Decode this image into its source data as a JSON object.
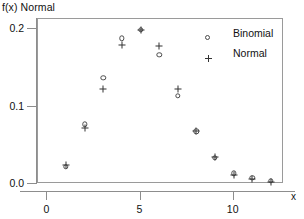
{
  "chart_data": {
    "type": "scatter",
    "title": "",
    "ylabel": "f(x) Normal",
    "xlabel": "x",
    "xlim": [
      -0.5,
      12.7
    ],
    "ylim": [
      0.0,
      0.213
    ],
    "grid": false,
    "x": [
      1,
      2,
      3,
      4,
      5,
      6,
      7,
      8,
      9,
      10,
      11,
      12
    ],
    "series": [
      {
        "name": "Binomial",
        "marker": "circle",
        "values": [
          0.022,
          0.077,
          0.137,
          0.188,
          0.199,
          0.167,
          0.114,
          0.068,
          0.034,
          0.014,
          0.008,
          0.004
        ]
      },
      {
        "name": "Normal",
        "marker": "plus",
        "values": [
          0.025,
          0.072,
          0.123,
          0.179,
          0.199,
          0.178,
          0.123,
          0.069,
          0.035,
          0.012,
          0.006,
          0.003
        ]
      }
    ],
    "yticks": [
      {
        "value": 0.0,
        "label": "0.0"
      },
      {
        "value": 0.1,
        "label": "0.1"
      },
      {
        "value": 0.2,
        "label": "0.2"
      }
    ],
    "xticks": [
      {
        "value": 0,
        "label": "0"
      },
      {
        "value": 5,
        "label": "5"
      },
      {
        "value": 10,
        "label": "10"
      }
    ],
    "legend": {
      "position": "top-right-inside",
      "entries": [
        {
          "label": "Binomial",
          "marker": "circle"
        },
        {
          "label": "Normal",
          "marker": "plus"
        }
      ]
    },
    "colors": {
      "binomial_marker": "#4a4a4a",
      "normal_marker": "#333333",
      "axis": "#8d8d8d",
      "frame": "#9a9a9a",
      "background": "#ffffff",
      "text": "#111111"
    }
  }
}
